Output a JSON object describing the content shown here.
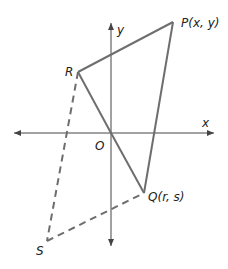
{
  "diagram": {
    "type": "coordinate-geometry",
    "colors": {
      "axis": "#444444",
      "solid": "#6e6e6e",
      "dashed": "#6e6e6e",
      "label": "#222222"
    },
    "axes": {
      "x_label": "x",
      "y_label": "y",
      "origin_label": "O"
    },
    "points": {
      "P": {
        "label": "P(x, y)"
      },
      "Q": {
        "label": "Q(r, s)"
      },
      "R": {
        "label": "R"
      },
      "S": {
        "label": "S"
      }
    },
    "segments": {
      "solid": [
        "RP",
        "PQ",
        "RO",
        "OQ"
      ],
      "dashed": [
        "RS",
        "SQ"
      ]
    }
  }
}
